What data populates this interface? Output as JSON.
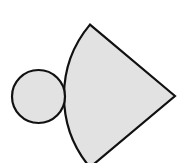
{
  "diagram": {
    "colors": {
      "fill": "#e2e2e2",
      "stroke": "#111111",
      "background": "#ffffff"
    },
    "stroke_width": 2.2,
    "circle": {
      "cx": 38.5,
      "cy": 96.5,
      "r": 26.5
    },
    "sector": {
      "cx": 175,
      "cy": 96,
      "r": 111,
      "top_point": [
        89,
        24
      ],
      "bottom_point": [
        89,
        168
      ],
      "arc_leftmost": [
        64,
        96
      ],
      "central_angle_deg": 80
    }
  }
}
